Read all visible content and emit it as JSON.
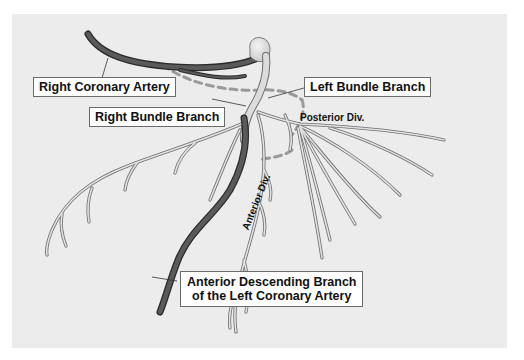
{
  "diagram": {
    "colors": {
      "background": "#ececec",
      "conduction_fill": "#dcdcdc",
      "conduction_outline": "#6f6f6f",
      "artery_fill": "#555555",
      "artery_outline": "#2a2a2a",
      "dashed_path": "#9a9a9a",
      "label_border": "#6a6a6a"
    },
    "labels": {
      "right_coronary_artery": "Right Coronary Artery",
      "left_bundle_branch": "Left Bundle Branch",
      "right_bundle_branch": "Right Bundle Branch",
      "posterior_division": "Posterior Div.",
      "anterior_division": "Anterior Div.",
      "anterior_descending_line1": "Anterior Descending Branch",
      "anterior_descending_line2": "of the Left Coronary Artery"
    }
  }
}
